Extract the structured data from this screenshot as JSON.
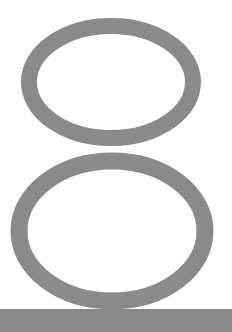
{
  "graphic": {
    "glyph": "8",
    "description": "Large outlined numeral eight on a base bar",
    "colors": {
      "background": "#ffffff",
      "stroke": "#8a8a8a",
      "bar": "#8a8a8a"
    },
    "top_loop": {
      "cx": 111,
      "cy": 82,
      "rx": 82,
      "ry": 56,
      "stroke_width": 16
    },
    "bottom_loop": {
      "cx": 112,
      "cy": 231,
      "rx": 93,
      "ry": 70,
      "stroke_width": 17
    },
    "base_bar": {
      "x": 0,
      "y": 309,
      "width": 232,
      "height": 23
    }
  }
}
